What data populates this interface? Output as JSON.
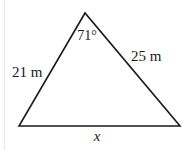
{
  "diagram": {
    "type": "triangle",
    "stroke_color": "#1a1a1a",
    "vertices": {
      "apex": [
        85,
        13
      ],
      "bottom_left": [
        19,
        126
      ],
      "bottom_right": [
        180,
        126
      ]
    },
    "angle_label": "71°",
    "left_side_label": "21 m",
    "right_side_label": "25 m",
    "base_label": "x"
  }
}
